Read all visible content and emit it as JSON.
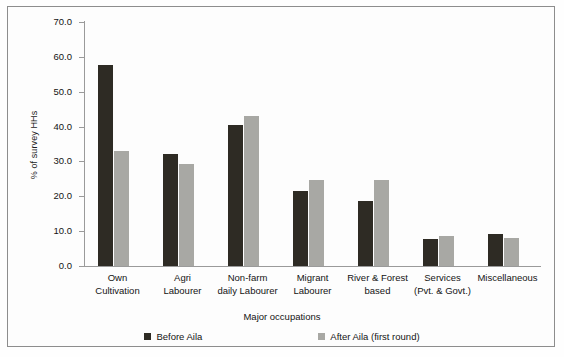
{
  "chart_data": {
    "type": "bar",
    "title": "",
    "xlabel": "Major occupations",
    "ylabel": "% of survey HHs",
    "ylim": [
      0,
      70
    ],
    "ytick_labels": [
      "70.0",
      "60.0",
      "50.0",
      "40.0",
      "30.0",
      "20.0",
      "10.0",
      "0.0"
    ],
    "ytick_values": [
      70,
      60,
      50,
      40,
      30,
      20,
      10,
      0
    ],
    "grid": false,
    "legend_position": "bottom",
    "categories": [
      "Own\nCultivation",
      "Agri\nLabourer",
      "Non-farm\ndaily Labourer",
      "Migrant\nLabourer",
      "River & Forest\nbased",
      "Services\n(Pvt. & Govt.)",
      "Miscellaneous"
    ],
    "category_lines": [
      [
        "Own",
        "Cultivation"
      ],
      [
        "Agri",
        "Labourer"
      ],
      [
        "Non-farm",
        "daily Labourer"
      ],
      [
        "Migrant",
        "Labourer"
      ],
      [
        "River & Forest",
        "based"
      ],
      [
        "Services",
        "(Pvt. & Govt.)"
      ],
      [
        "Miscellaneous",
        ""
      ]
    ],
    "series": [
      {
        "name": "Before Aila",
        "color": "#2e2b24",
        "values": [
          57.8,
          32.0,
          40.4,
          21.4,
          18.6,
          7.7,
          9.1
        ]
      },
      {
        "name": "After Aila (first round)",
        "color": "#a8a8a4",
        "values": [
          32.9,
          29.4,
          43.1,
          24.6,
          24.6,
          8.6,
          8.0
        ]
      }
    ]
  },
  "legend": {
    "items": [
      {
        "label": "Before Aila"
      },
      {
        "label": "After Aila (first round)"
      }
    ]
  }
}
